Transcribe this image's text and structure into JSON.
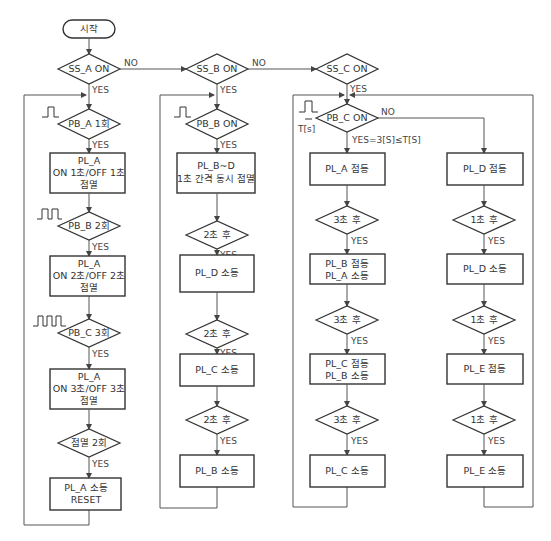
{
  "diagram": {
    "type": "flowchart",
    "start": "시작",
    "labels": {
      "yes": "YES",
      "no": "NO",
      "tsec": "T[s]",
      "pbc_yes": "YES=3[S]≤T[S]"
    },
    "col_a": {
      "condition": "SS_A ON",
      "steps": [
        {
          "kind": "decision",
          "text": "PB_A 1회"
        },
        {
          "kind": "process",
          "lines": [
            "PL_A",
            "ON 1초/OFF 1초",
            "점멸"
          ]
        },
        {
          "kind": "decision",
          "text": "PB_B 2회"
        },
        {
          "kind": "process",
          "lines": [
            "PL_A",
            "ON 2초/OFF 2초",
            "점멸"
          ]
        },
        {
          "kind": "decision",
          "text": "PB_C 3회"
        },
        {
          "kind": "process",
          "lines": [
            "PL_A",
            "ON 3초/OFF 3초",
            "점멸"
          ]
        },
        {
          "kind": "decision",
          "text": "점멸 2회"
        },
        {
          "kind": "process",
          "lines": [
            "PL_A 소등",
            "RESET"
          ]
        }
      ]
    },
    "col_b": {
      "condition": "SS_B ON",
      "steps": [
        {
          "kind": "decision",
          "text": "PB_B ON"
        },
        {
          "kind": "process",
          "lines": [
            "PL_B~D",
            "1초 간격 동시 점멸"
          ]
        },
        {
          "kind": "decision",
          "text": "2초 후"
        },
        {
          "kind": "process",
          "lines": [
            "PL_D 소등"
          ]
        },
        {
          "kind": "decision",
          "text": "2초 후"
        },
        {
          "kind": "process",
          "lines": [
            "PL_C 소등"
          ]
        },
        {
          "kind": "decision",
          "text": "2초 후"
        },
        {
          "kind": "process",
          "lines": [
            "PL_B 소등"
          ]
        }
      ]
    },
    "col_c": {
      "condition": "SS_C ON",
      "decision": "PB_C ON",
      "yes_branch": [
        {
          "kind": "process",
          "lines": [
            "PL_A 점등"
          ]
        },
        {
          "kind": "decision",
          "text": "3초 후"
        },
        {
          "kind": "process",
          "lines": [
            "PL_B 점등",
            "PL_A 소등"
          ]
        },
        {
          "kind": "decision",
          "text": "3초 후"
        },
        {
          "kind": "process",
          "lines": [
            "PL_C 점등",
            "PL_B 소등"
          ]
        },
        {
          "kind": "decision",
          "text": "3초 후"
        },
        {
          "kind": "process",
          "lines": [
            "PL_C 소등"
          ]
        }
      ],
      "no_branch": [
        {
          "kind": "process",
          "lines": [
            "PL_D 점등"
          ]
        },
        {
          "kind": "decision",
          "text": "1초 후"
        },
        {
          "kind": "process",
          "lines": [
            "PL_D 소등"
          ]
        },
        {
          "kind": "decision",
          "text": "1초 후"
        },
        {
          "kind": "process",
          "lines": [
            "PL_E 점등"
          ]
        },
        {
          "kind": "decision",
          "text": "1초 후"
        },
        {
          "kind": "process",
          "lines": [
            "PL_E 소등"
          ]
        }
      ]
    }
  }
}
